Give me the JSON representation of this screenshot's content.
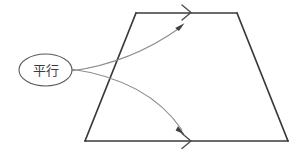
{
  "figure": {
    "type": "geometry-diagram",
    "background_color": "#ffffff",
    "width": 305,
    "height": 158
  },
  "callout": {
    "label": "平行",
    "shape": "ellipse",
    "center_x": 45.5,
    "center_y": 70,
    "radius_x": 26.5,
    "radius_y": 16,
    "stroke_color": "#5a5a5a",
    "fill_color": "#ffffff",
    "text_color": "#3c3c3c"
  },
  "trapezoid": {
    "stroke_color": "#3a3a3a",
    "stroke_width": 1.6,
    "vertices": [
      {
        "name": "top-left",
        "x": 136,
        "y": 13
      },
      {
        "name": "top-right",
        "x": 237,
        "y": 13
      },
      {
        "name": "bottom-right",
        "x": 288,
        "y": 141
      },
      {
        "name": "bottom-left",
        "x": 85,
        "y": 141
      }
    ],
    "edges": [
      {
        "name": "top-edge",
        "from": "top-left",
        "to": "top-right",
        "marked_parallel": true
      },
      {
        "name": "right-edge",
        "from": "top-right",
        "to": "bottom-right",
        "marked_parallel": false
      },
      {
        "name": "bottom-edge",
        "from": "bottom-right",
        "to": "bottom-left",
        "marked_parallel": true
      },
      {
        "name": "left-edge",
        "from": "bottom-left",
        "to": "top-left",
        "marked_parallel": false
      }
    ]
  },
  "parallel_marks": [
    {
      "name": "top-parallel-mark",
      "edge": "top-edge",
      "glyph": "chevron",
      "x": 188,
      "y": 12.5,
      "size": 8,
      "stroke_color": "#4a4a4a"
    },
    {
      "name": "bottom-parallel-mark",
      "edge": "bottom-edge",
      "glyph": "chevron",
      "x": 188,
      "y": 141,
      "size": 8,
      "stroke_color": "#4a4a4a"
    }
  ],
  "leaders": [
    {
      "name": "upper-leader",
      "from_x": 71,
      "from_y": 71,
      "to_x": 182,
      "to_y": 25,
      "control_x": 130,
      "control_y": 62,
      "target": "top-edge",
      "stroke_color": "#8d8d8d",
      "arrow_color": "#4a4a4a",
      "arrow_rotation": -38
    },
    {
      "name": "lower-leader",
      "from_x": 71,
      "from_y": 69,
      "to_x": 183,
      "to_y": 133,
      "control_x": 146,
      "control_y": 80,
      "target": "bottom-edge",
      "stroke_color": "#8d8d8d",
      "arrow_color": "#4a4a4a",
      "arrow_rotation": 52
    }
  ]
}
